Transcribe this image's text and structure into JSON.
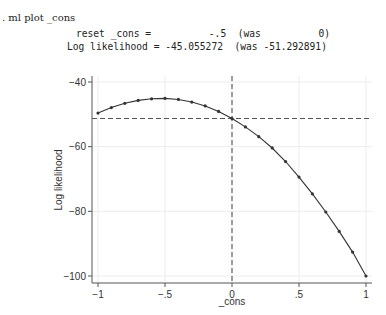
{
  "console": {
    "command": ". ml plot _cons",
    "reset_line": "reset _cons =          -.5  (was          0)",
    "ll_line": "Log likelihood = -45.055272  (was -51.292891)"
  },
  "chart_data": {
    "type": "line",
    "title": "",
    "xlabel": "_cons",
    "ylabel": "Log likelihood",
    "xlim": [
      -1,
      1
    ],
    "ylim": [
      -100,
      -40
    ],
    "xticks": [
      -1,
      -0.5,
      0,
      0.5,
      1
    ],
    "xtick_labels": [
      "-1",
      "-.5",
      "0",
      ".5",
      "1"
    ],
    "yticks": [
      -40,
      -60,
      -80,
      -100
    ],
    "ytick_labels": [
      "-40",
      "-60",
      "-80",
      "-100"
    ],
    "grid": true,
    "x": [
      -1,
      -0.9,
      -0.8,
      -0.7,
      -0.6,
      -0.5,
      -0.4,
      -0.3,
      -0.2,
      -0.1,
      0,
      0.1,
      0.2,
      0.3,
      0.4,
      0.5,
      0.6,
      0.7,
      0.8,
      0.9,
      1
    ],
    "values": [
      -49.6,
      -47.9,
      -46.6,
      -45.7,
      -45.2,
      -45.06,
      -45.4,
      -46.2,
      -47.4,
      -49.1,
      -51.29,
      -53.9,
      -56.9,
      -60.4,
      -64.6,
      -69.4,
      -74.6,
      -80.2,
      -86.2,
      -92.6,
      -100.0
    ],
    "reference_lines": {
      "vertical_x": 0,
      "horizontal_y": -51.292891
    }
  }
}
